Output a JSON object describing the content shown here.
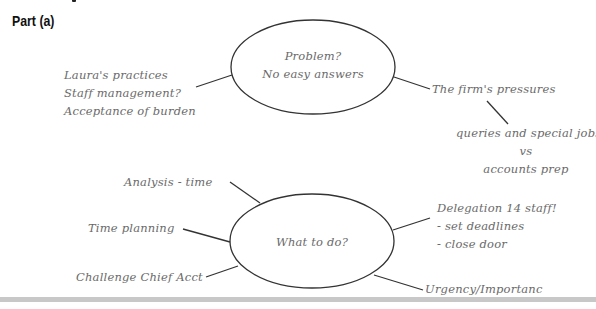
{
  "heading": "Part (a)",
  "top_node": {
    "line1": "Problem?",
    "line2": "No easy answers",
    "left_branch": [
      "Laura's practices",
      "Staff management?",
      "Acceptance of burden"
    ],
    "right_branch": "The firm's pressures",
    "sub_branch": [
      "queries and special jobs",
      "vs",
      "accounts prep"
    ]
  },
  "bottom_node": {
    "label": "What to do?",
    "left_branches": [
      "Analysis - time",
      "Time planning",
      "Challenge Chief Acct"
    ],
    "right_branch": [
      "Delegation 14 staff!",
      "- set deadlines",
      "- close door"
    ],
    "bottom_right_branch": "Urgency/Importanc"
  },
  "colors": {
    "line": "#333333",
    "text": "#6a6a6a",
    "bar": "#c8c8c8"
  }
}
